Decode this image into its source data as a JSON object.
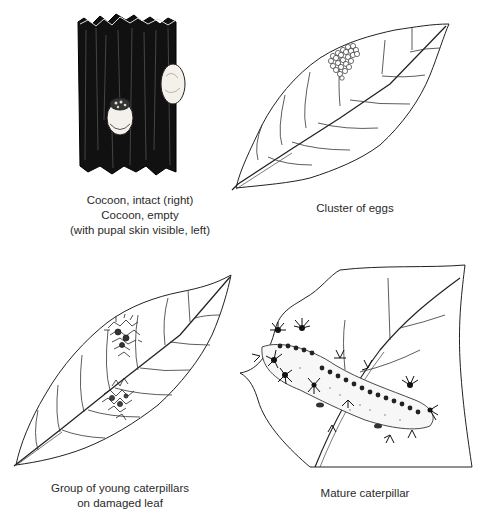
{
  "figure": {
    "panels": [
      {
        "id": "cocoons",
        "caption_lines": [
          "Cocoon, intact (right)",
          "Cocoon, empty",
          "(with pupal skin visible, left)"
        ],
        "elements": [
          "bark",
          "cocoon-intact-right",
          "cocoon-empty-left"
        ]
      },
      {
        "id": "eggs",
        "caption_lines": [
          "Cluster of eggs"
        ],
        "elements": [
          "leaf",
          "egg-cluster"
        ]
      },
      {
        "id": "young-caterpillars",
        "caption_lines": [
          "Group of young caterpillars",
          "on damaged leaf"
        ],
        "elements": [
          "leaf",
          "caterpillar-group-upper",
          "caterpillar-group-lower"
        ]
      },
      {
        "id": "mature-caterpillar",
        "caption_lines": [
          "Mature caterpillar"
        ],
        "elements": [
          "damaged-leaf",
          "caterpillar"
        ]
      }
    ],
    "colors": {
      "ink": "#1a1a1a",
      "background": "#ffffff",
      "bark": "#111111"
    }
  }
}
